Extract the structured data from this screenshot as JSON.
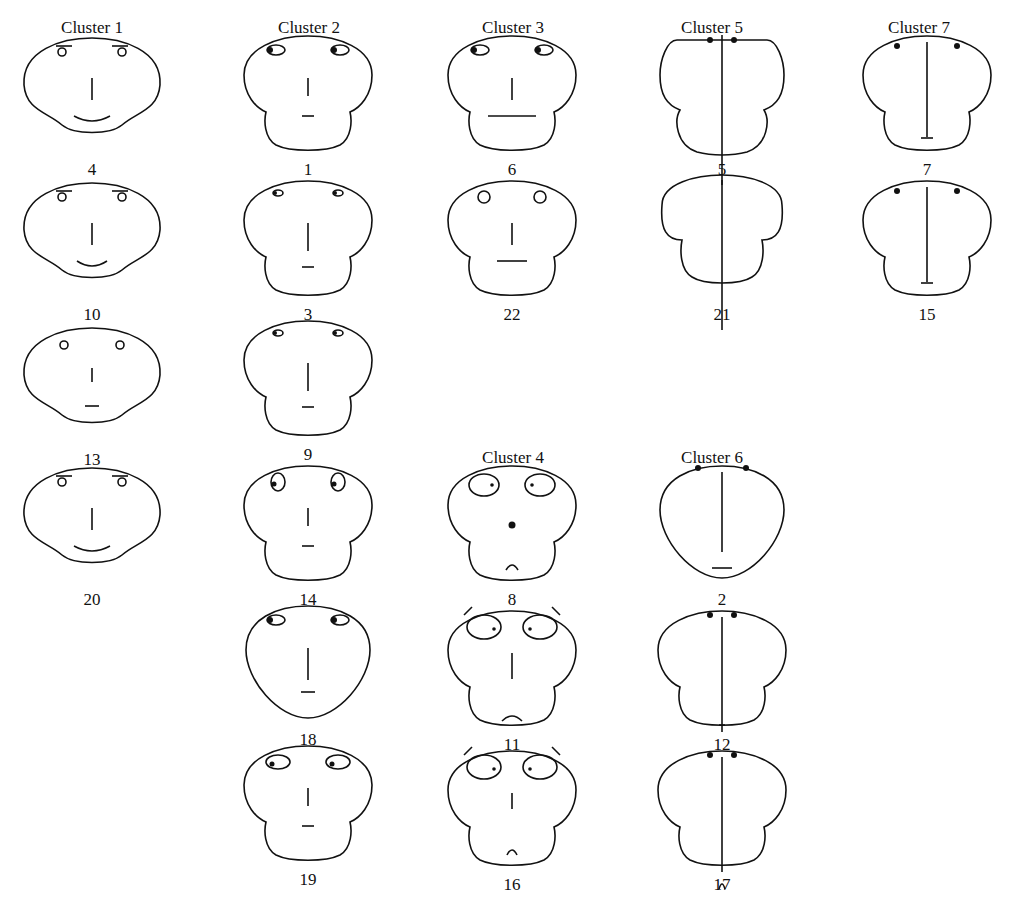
{
  "figure": {
    "titles": [
      {
        "id": "c1",
        "label": "Cluster 1",
        "x": 22,
        "y": 18
      },
      {
        "id": "c2",
        "label": "Cluster 2",
        "x": 239,
        "y": 18
      },
      {
        "id": "c3",
        "label": "Cluster 3",
        "x": 443,
        "y": 18
      },
      {
        "id": "c5",
        "label": "Cluster 5",
        "x": 642,
        "y": 18
      },
      {
        "id": "c7",
        "label": "Cluster 7",
        "x": 849,
        "y": 18
      },
      {
        "id": "c4",
        "label": "Cluster 4",
        "x": 443,
        "y": 448
      },
      {
        "id": "c6",
        "label": "Cluster 6",
        "x": 642,
        "y": 448
      }
    ],
    "faces": [
      {
        "n": "4",
        "cx": 92,
        "cy": 90,
        "shape": "tri",
        "eyes": "brow-small",
        "nose": 22,
        "mouth": "smile",
        "mw": 36
      },
      {
        "n": "10",
        "cx": 92,
        "cy": 235,
        "shape": "tri",
        "eyes": "brow-small",
        "nose": 22,
        "mouth": "smile",
        "mw": 30
      },
      {
        "n": "13",
        "cx": 92,
        "cy": 380,
        "shape": "tri",
        "eyes": "small",
        "nose": 14,
        "mouth": "flat",
        "mw": 14
      },
      {
        "n": "20",
        "cx": 92,
        "cy": 520,
        "shape": "tri",
        "eyes": "brow-small",
        "nose": 22,
        "mouth": "smile",
        "mw": 36
      },
      {
        "n": "1",
        "cx": 308,
        "cy": 90,
        "shape": "mush",
        "eyes": "oval-dark",
        "nose": 18,
        "mouth": "flat",
        "mw": 12
      },
      {
        "n": "3",
        "cx": 308,
        "cy": 235,
        "shape": "mush",
        "eyes": "oval-thin",
        "nose": 28,
        "mouth": "flat",
        "mw": 12
      },
      {
        "n": "9",
        "cx": 308,
        "cy": 375,
        "shape": "mush",
        "eyes": "oval-thin",
        "nose": 28,
        "mouth": "flat",
        "mw": 12
      },
      {
        "n": "14",
        "cx": 308,
        "cy": 520,
        "shape": "mush",
        "eyes": "oval-tilt",
        "nose": 18,
        "mouth": "flat",
        "mw": 12
      },
      {
        "n": "18",
        "cx": 308,
        "cy": 660,
        "shape": "egg",
        "eyes": "oval-dark",
        "nose": 32,
        "mouth": "flat",
        "mw": 14
      },
      {
        "n": "19",
        "cx": 308,
        "cy": 800,
        "shape": "mush",
        "eyes": "oval-big",
        "nose": 18,
        "mouth": "flat",
        "mw": 12
      },
      {
        "n": "6",
        "cx": 512,
        "cy": 90,
        "shape": "mush",
        "eyes": "oval-dark",
        "nose": 22,
        "mouth": "flat",
        "mw": 48
      },
      {
        "n": "22",
        "cx": 512,
        "cy": 235,
        "shape": "mush",
        "eyes": "round",
        "nose": 22,
        "mouth": "flat",
        "mw": 30
      },
      {
        "n": "8",
        "cx": 512,
        "cy": 520,
        "shape": "mush",
        "eyes": "big-dot",
        "nose": 0,
        "mouth": "frown",
        "mw": 12,
        "dot": true
      },
      {
        "n": "11",
        "cx": 512,
        "cy": 665,
        "shape": "mush",
        "eyes": "big-brow",
        "nose": 26,
        "mouth": "frown",
        "mw": 20
      },
      {
        "n": "16",
        "cx": 512,
        "cy": 805,
        "shape": "mush",
        "eyes": "big-brow",
        "nose": 16,
        "mouth": "frown",
        "mw": 10
      },
      {
        "n": "5",
        "cx": 722,
        "cy": 90,
        "shape": "narrow",
        "eyes": "dots-close",
        "nose": 150,
        "mouth": "none",
        "mw": 0
      },
      {
        "n": "21",
        "cx": 722,
        "cy": 235,
        "shape": "wide",
        "eyes": "none",
        "nose": 150,
        "mouth": "none",
        "mw": 0
      },
      {
        "n": "2",
        "cx": 722,
        "cy": 520,
        "shape": "egg",
        "eyes": "dots-top",
        "nose": 80,
        "mouth": "flat",
        "mw": 20
      },
      {
        "n": "12",
        "cx": 722,
        "cy": 665,
        "shape": "mush",
        "eyes": "dots-close",
        "nose": 115,
        "mouth": "flat",
        "mw": 6
      },
      {
        "n": "17",
        "cx": 722,
        "cy": 805,
        "shape": "mush",
        "eyes": "dots-close",
        "nose": 115,
        "mouth": "frown",
        "mw": 6
      },
      {
        "n": "7",
        "cx": 927,
        "cy": 90,
        "shape": "mush",
        "eyes": "dots-wide",
        "nose": 95,
        "mouth": "flat",
        "mw": 12
      },
      {
        "n": "15",
        "cx": 927,
        "cy": 235,
        "shape": "mush",
        "eyes": "dots-wide",
        "nose": 95,
        "mouth": "flat",
        "mw": 12
      }
    ]
  }
}
